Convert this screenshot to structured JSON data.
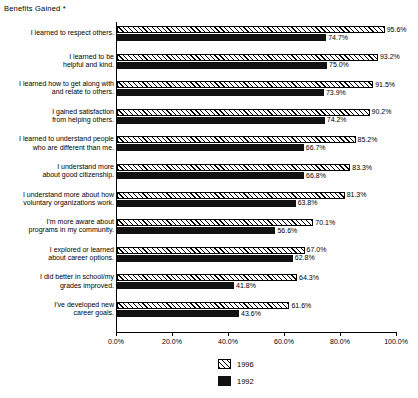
{
  "chart_data": {
    "type": "bar",
    "orientation": "horizontal",
    "title": "Benefits Gained *",
    "xlabel": "",
    "ylabel": "",
    "xlim": [
      0,
      100
    ],
    "grid": false,
    "legend_position": "bottom-center",
    "tick_labels": [
      "0.0%",
      "20.0%",
      "40.0%",
      "60.0%",
      "80.0%",
      "100.0%"
    ],
    "tick_values": [
      0,
      20,
      40,
      60,
      80,
      100
    ],
    "categories": [
      "I learned to respect others.",
      "I learned to be\nhelpful and kind.",
      "I learned how to get along with\nand relate to others.",
      "I gained satisfaction\nfrom helping others.",
      "I learned to understand people\nwho are different than me.",
      "I understand more\nabout good citizenship.",
      "I understand more about how\nvoluntary organizations work.",
      "I'm more aware about\nprograms in my community.",
      "I explored or learned\nabout career options.",
      "I did better in school/my\ngrades improved.",
      "I've developed new\ncareer goals."
    ],
    "series": [
      {
        "name": "1996",
        "values": [
          95.6,
          93.2,
          91.5,
          90.2,
          85.2,
          83.3,
          81.3,
          70.1,
          67.0,
          64.3,
          61.6
        ],
        "labels": [
          "95.6%",
          "93.2%",
          "91.5%",
          "90.2%",
          "85.2%",
          "83.3%",
          "81.3%",
          "70.1%",
          "67.0%",
          "64.3%",
          "61.6%"
        ]
      },
      {
        "name": "1992",
        "values": [
          74.7,
          75.0,
          73.9,
          74.2,
          66.7,
          66.8,
          63.8,
          56.6,
          62.8,
          41.8,
          43.6
        ],
        "labels": [
          "74.7%",
          "75.0%",
          "73.9%",
          "74.2%",
          "66.7%",
          "66.8%",
          "63.8%",
          "56.6%",
          "62.8%",
          "41.8%",
          "43.6%"
        ]
      }
    ]
  },
  "legend": {
    "items": [
      {
        "label": "1996",
        "pattern": "diagonal-hatch",
        "color": "#000000"
      },
      {
        "label": "1992",
        "pattern": "solid",
        "color": "#111111"
      }
    ]
  }
}
